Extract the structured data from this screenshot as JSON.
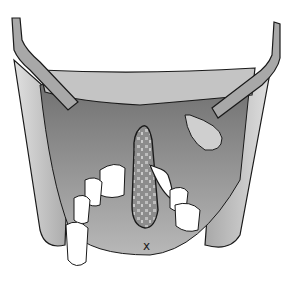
{
  "figure": {
    "colors": {
      "background": "#ffffff",
      "outline": "#1a1a1a",
      "soft_tissue": "#c8c8c8",
      "deep_tissue": "#8a8a8a",
      "palate": "#bdbdbd",
      "teeth": "#ffffff",
      "graft": "#7a7a7a",
      "retractor": "#a0a0a0"
    },
    "annotation_mark": "x"
  }
}
